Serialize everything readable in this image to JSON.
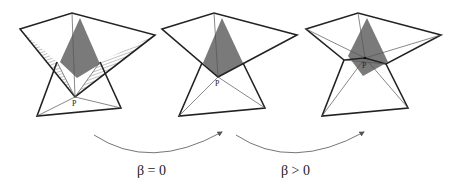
{
  "figure": {
    "panels": [
      {
        "id": "panel-1",
        "point_label": "P",
        "description": "Bottom triangle below upper quadrilateral with hatched gap regions"
      },
      {
        "id": "panel-2",
        "point_label": "P",
        "description": "Triangles meet at point P"
      },
      {
        "id": "panel-3",
        "point_label": "P",
        "description": "Triangles overlap around point P"
      }
    ],
    "transitions": [
      {
        "label": "β = 0"
      },
      {
        "label": "β > 0"
      }
    ],
    "colors": {
      "line": "#222222",
      "thin_line": "#555555",
      "shade": "#7a7a7a",
      "hatch": "#666666",
      "arrow": "#666666"
    }
  }
}
